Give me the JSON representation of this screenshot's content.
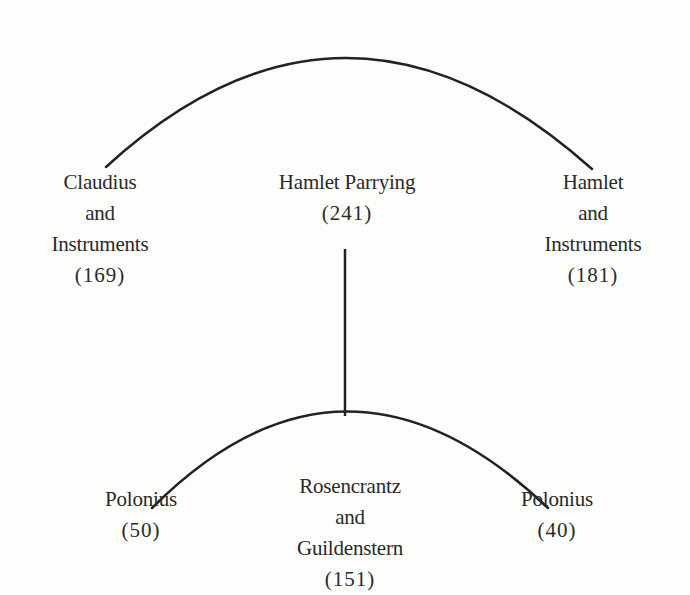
{
  "diagram": {
    "type": "tree",
    "top_group": {
      "nodes": [
        {
          "id": "claudius-and-instruments",
          "lines": [
            "Claudius",
            "and",
            "Instruments"
          ],
          "count": "(169)"
        },
        {
          "id": "hamlet-parrying",
          "lines": [
            "Hamlet Parrying"
          ],
          "count": "(241)"
        },
        {
          "id": "hamlet-and-instruments",
          "lines": [
            "Hamlet",
            "and",
            "Instruments"
          ],
          "count": "(181)"
        }
      ]
    },
    "bottom_group": {
      "nodes": [
        {
          "id": "polonius-left",
          "lines": [
            "Polonius"
          ],
          "count": "(50)"
        },
        {
          "id": "rosencrantz-and-guildenstern",
          "lines": [
            "Rosencrantz",
            "and",
            "Guildenstern"
          ],
          "count": "(151)"
        },
        {
          "id": "polonius-right",
          "lines": [
            "Polonius"
          ],
          "count": "(40)"
        }
      ]
    },
    "edges": [
      {
        "from": "hamlet-parrying",
        "to": "bottom_group",
        "style": "vertical-line"
      }
    ],
    "colors": {
      "line": "#222222",
      "text": "#2a2a2a",
      "background": "#fdfdfb"
    }
  }
}
